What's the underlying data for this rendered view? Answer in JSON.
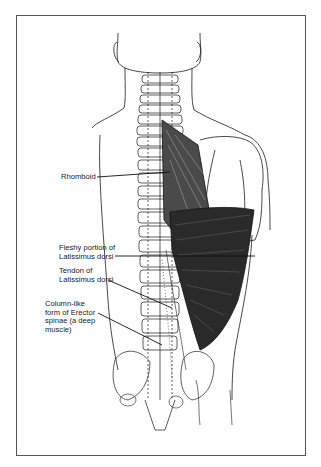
{
  "figure": {
    "labels": [
      {
        "id": "rhomboid",
        "text": "Rhomboid"
      },
      {
        "id": "fleshy-latissimus",
        "text": "Fleshy portion of\nLatissimus dorsi"
      },
      {
        "id": "tendon-latissimus",
        "text": "Tendon of\nLatissimus dorsi"
      },
      {
        "id": "erector-spinae",
        "text": "Column-like\nform of Erector\nspinae (a deep\nmuscle)"
      }
    ]
  },
  "colors": {
    "line": "#1a1a1a",
    "frame": "#555555",
    "background": "#ffffff"
  }
}
